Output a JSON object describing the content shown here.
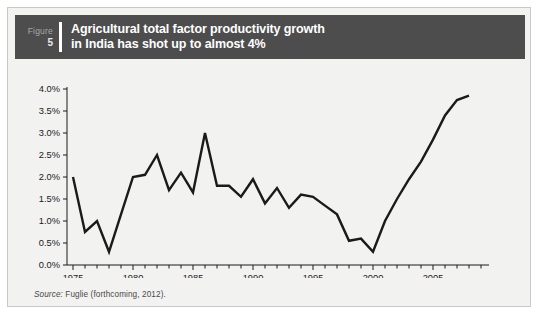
{
  "figure": {
    "label_word": "Figure",
    "number": "5",
    "title_line1": "Agricultural total factor productivity growth",
    "title_line2": "in India has shot up to almost 4%",
    "header_bg": "#4d4d4d",
    "panel_bg": "#f2f2f0"
  },
  "source": {
    "label": "Source:",
    "text": " Fuglie (forthcoming, 2012)."
  },
  "chart_data": {
    "type": "line",
    "title": "Agricultural total factor productivity growth in India has shot up to almost 4%",
    "xlabel": "",
    "ylabel": "",
    "xlim": [
      1974.5,
      2009
    ],
    "ylim": [
      0.0,
      4.0
    ],
    "grid": false,
    "legend": null,
    "line_color": "#1a1a1a",
    "x_tick_labels": [
      "1975",
      "1980",
      "1985",
      "1990",
      "1995",
      "2000",
      "2005"
    ],
    "x_tick_values": [
      1975,
      1980,
      1985,
      1990,
      1995,
      2000,
      2005
    ],
    "x_minor_tick_step": 1,
    "y_tick_labels": [
      "0.0%",
      "0.5%",
      "1.0%",
      "1.5%",
      "2.0%",
      "2.5%",
      "3.0%",
      "3.5%",
      "4.0%"
    ],
    "y_tick_values": [
      0.0,
      0.5,
      1.0,
      1.5,
      2.0,
      2.5,
      3.0,
      3.5,
      4.0
    ],
    "x": [
      1975,
      1976,
      1977,
      1978,
      1979,
      1980,
      1981,
      1982,
      1983,
      1984,
      1985,
      1986,
      1987,
      1988,
      1989,
      1990,
      1991,
      1992,
      1993,
      1994,
      1995,
      1996,
      1997,
      1998,
      1999,
      2000,
      2001,
      2002,
      2003,
      2004,
      2005,
      2006,
      2007,
      2008
    ],
    "values": [
      2.0,
      0.75,
      1.0,
      0.3,
      1.15,
      2.0,
      2.05,
      2.5,
      1.7,
      2.1,
      1.65,
      3.0,
      1.8,
      1.8,
      1.55,
      1.95,
      1.4,
      1.75,
      1.3,
      1.6,
      1.55,
      1.35,
      1.15,
      0.55,
      0.6,
      0.3,
      1.0,
      1.5,
      1.95,
      2.35,
      2.85,
      3.4,
      3.75,
      3.85
    ],
    "series_name": "Agricultural TFP growth, India"
  }
}
